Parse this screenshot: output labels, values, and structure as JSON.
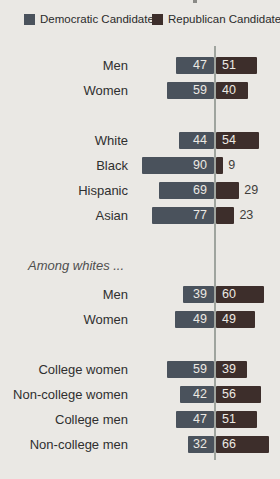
{
  "legend": [
    {
      "label": "Democratic Candidate",
      "color": "#4a525c"
    },
    {
      "label": "Republican Candidate",
      "color": "#3d2e2b"
    }
  ],
  "chart_data": {
    "type": "bar",
    "orientation": "horizontal-diverging",
    "series_names": [
      "Democratic Candidate",
      "Republican Candidate"
    ],
    "colors": {
      "democratic": "#4a525c",
      "republican": "#3d2e2b",
      "axis_line": "#9fa49e",
      "value_inside": "#ece9e3",
      "value_outside": "#3f3d3a",
      "background": "#eae8e4"
    },
    "value_unit": "percent",
    "rows": [
      {
        "type": "bar",
        "label": "Men",
        "dem": 47,
        "rep": 51
      },
      {
        "type": "bar",
        "label": "Women",
        "dem": 59,
        "rep": 40
      },
      {
        "type": "gap"
      },
      {
        "type": "bar",
        "label": "White",
        "dem": 44,
        "rep": 54
      },
      {
        "type": "bar",
        "label": "Black",
        "dem": 90,
        "rep": 9,
        "rep_outside": true
      },
      {
        "type": "bar",
        "label": "Hispanic",
        "dem": 69,
        "rep": 29,
        "rep_outside": true
      },
      {
        "type": "bar",
        "label": "Asian",
        "dem": 77,
        "rep": 23,
        "rep_outside": true
      },
      {
        "type": "gap"
      },
      {
        "type": "section",
        "label": "Among whites ..."
      },
      {
        "type": "bar",
        "label": "Men",
        "dem": 39,
        "rep": 60
      },
      {
        "type": "bar",
        "label": "Women",
        "dem": 49,
        "rep": 49
      },
      {
        "type": "gap"
      },
      {
        "type": "bar",
        "label": "College women",
        "dem": 59,
        "rep": 39
      },
      {
        "type": "bar",
        "label": "Non-college women",
        "dem": 42,
        "rep": 56
      },
      {
        "type": "bar",
        "label": "College men",
        "dem": 47,
        "rep": 51
      },
      {
        "type": "bar",
        "label": "Non-college men",
        "dem": 32,
        "rep": 66
      }
    ]
  }
}
